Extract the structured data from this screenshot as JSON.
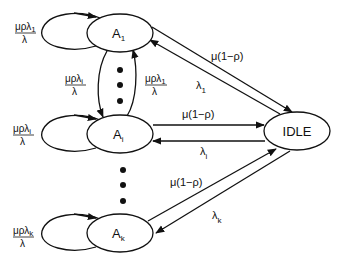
{
  "diagram": {
    "type": "state-transition",
    "nodes": [
      {
        "id": "A1",
        "label": "A",
        "sub": "1"
      },
      {
        "id": "Ai",
        "label": "A",
        "sub": "i"
      },
      {
        "id": "Ak",
        "label": "A",
        "sub": "k"
      },
      {
        "id": "IDLE",
        "label": "IDLE"
      }
    ],
    "self_loops": [
      {
        "node": "A1",
        "num": "μρλ",
        "num_sub": "1",
        "den": "λ"
      },
      {
        "node": "Ai",
        "num": "μρλ",
        "num_sub": "i",
        "den": "λ"
      },
      {
        "node": "Ak",
        "num": "μρλ",
        "num_sub": "k",
        "den": "λ"
      }
    ],
    "inter_edges": [
      {
        "from": "A1",
        "to": "Ai",
        "num": "μρλ",
        "num_sub": "i",
        "den": "λ"
      },
      {
        "from": "Ai",
        "to": "A1",
        "num": "μρλ",
        "num_sub": "1",
        "den": "λ"
      }
    ],
    "idle_edges": [
      {
        "from": "A1",
        "to": "IDLE",
        "label": "μ(1−ρ)"
      },
      {
        "from": "IDLE",
        "to": "A1",
        "label": "λ",
        "sub": "1"
      },
      {
        "from": "Ai",
        "to": "IDLE",
        "label": "μ(1−ρ)"
      },
      {
        "from": "IDLE",
        "to": "Ai",
        "label": "λ",
        "sub": "i"
      },
      {
        "from": "Ak",
        "to": "IDLE",
        "label": "μ(1−ρ)"
      },
      {
        "from": "IDLE",
        "to": "Ak",
        "label": "λ",
        "sub": "k"
      }
    ],
    "ellipsis": "⋮"
  }
}
